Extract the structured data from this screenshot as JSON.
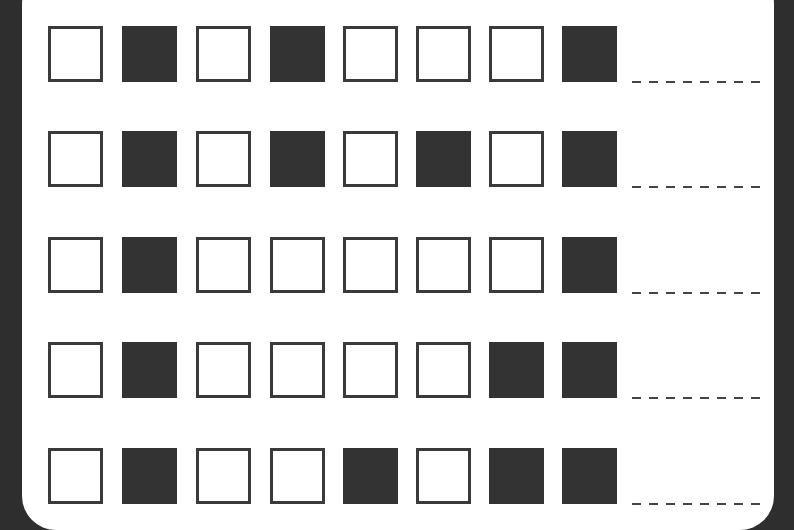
{
  "worksheet": {
    "title": "",
    "colors": {
      "filled": "#333333",
      "empty": "#ffffff",
      "border": "#2e2e2e"
    },
    "rows": [
      {
        "bits": [
          0,
          1,
          0,
          1,
          0,
          0,
          0,
          1
        ],
        "answer": ""
      },
      {
        "bits": [
          0,
          1,
          0,
          1,
          0,
          1,
          0,
          1
        ],
        "answer": ""
      },
      {
        "bits": [
          0,
          1,
          0,
          0,
          0,
          0,
          0,
          1
        ],
        "answer": ""
      },
      {
        "bits": [
          0,
          1,
          0,
          0,
          0,
          0,
          1,
          1
        ],
        "answer": ""
      },
      {
        "bits": [
          0,
          1,
          0,
          0,
          1,
          0,
          1,
          1
        ],
        "answer": ""
      }
    ]
  }
}
